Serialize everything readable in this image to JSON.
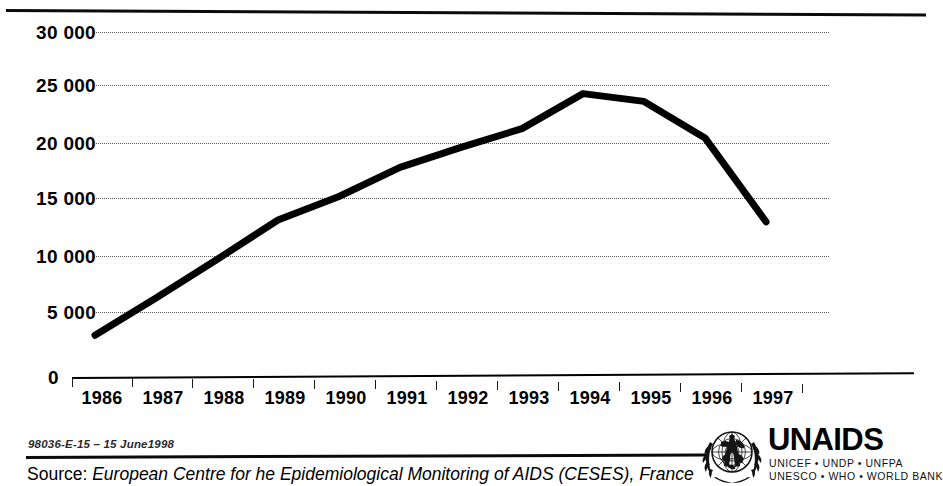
{
  "chart_data": {
    "type": "line",
    "title": "",
    "subtitle": "",
    "xlabel": "",
    "ylabel": "",
    "categories": [
      "1986",
      "1987",
      "1988",
      "1989",
      "1990",
      "1991",
      "1992",
      "1993",
      "1994",
      "1995",
      "1996",
      "1997"
    ],
    "values": [
      3700,
      6900,
      10200,
      13600,
      15600,
      18100,
      19800,
      21400,
      24400,
      23700,
      20500,
      13200
    ],
    "series": [
      {
        "name": "AIDS cases",
        "values": [
          3700,
          6900,
          10200,
          13600,
          15600,
          18100,
          19800,
          21400,
          24400,
          23700,
          20500,
          13200
        ]
      }
    ],
    "ylim": [
      0,
      30000
    ],
    "y_ticks": [
      0,
      5000,
      10000,
      15000,
      20000,
      25000,
      30000
    ],
    "y_tick_labels": [
      "0",
      "5 000",
      "10 000",
      "15 000",
      "20 000",
      "25 000",
      "30 000"
    ],
    "x_tick_labels": [
      "1986",
      "1987",
      "1988",
      "1989",
      "1990",
      "1991",
      "1992",
      "1993",
      "1994",
      "1995",
      "1996",
      "1997"
    ],
    "grid": true,
    "grid_style": "dotted-horizontal",
    "legend": false,
    "legend_position": "none",
    "line_color": "#000000",
    "line_width": 7,
    "marker": "none"
  },
  "axes": {
    "y_labels": [
      "30 000",
      "25 000",
      "20 000",
      "15 000",
      "10 000",
      "5 000"
    ],
    "zero_label": "0",
    "x_labels": [
      "1986",
      "1987",
      "1988",
      "1989",
      "1990",
      "1991",
      "1992",
      "1993",
      "1994",
      "1995",
      "1996",
      "1997"
    ]
  },
  "footer": {
    "doc_code": "98036-E-15 – 15 June1998",
    "source_label": "Source:",
    "source_text": "European Centre for he Epidemiological Monitoring of AIDS (CESES), France"
  },
  "logo": {
    "wordmark": "UNAIDS",
    "sub_line_1": "UNICEF • UNDP • UNFPA",
    "sub_line_2": "UNESCO • WHO • WORLD BANK",
    "emblem_name": "un-globe-laurel-red-ribbon-emblem"
  },
  "colors": {
    "ink": "#000000",
    "grid": "#5a5a5a",
    "paper": "#ffffff",
    "ribbon": "#1a1a1a"
  }
}
